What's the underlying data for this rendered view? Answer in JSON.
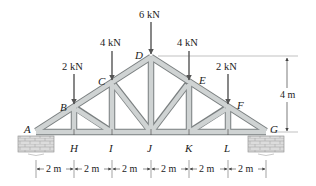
{
  "diagram": {
    "type": "roof truss",
    "colors": {
      "member_fill": "#cfd3d3",
      "member_edge": "#7a7f80",
      "load_arrow": "#555555",
      "support_fill": "#d8d8d8",
      "dim_line": "#444444"
    },
    "nodes": {
      "A": {
        "label": "A"
      },
      "B": {
        "label": "B"
      },
      "C": {
        "label": "C"
      },
      "D": {
        "label": "D"
      },
      "E": {
        "label": "E"
      },
      "F": {
        "label": "F"
      },
      "G": {
        "label": "G"
      },
      "H": {
        "label": "H"
      },
      "I": {
        "label": "I"
      },
      "J": {
        "label": "J"
      },
      "K": {
        "label": "K"
      },
      "L": {
        "label": "L"
      }
    },
    "loads": [
      {
        "node": "B",
        "label": "2 kN"
      },
      {
        "node": "C",
        "label": "4 kN"
      },
      {
        "node": "D",
        "label": "6 kN"
      },
      {
        "node": "E",
        "label": "4 kN"
      },
      {
        "node": "F",
        "label": "2 kN"
      }
    ],
    "dimensions": {
      "spans": [
        "2 m",
        "2 m",
        "2 m",
        "2 m",
        "2 m",
        "2 m"
      ],
      "height": "4 m"
    }
  }
}
